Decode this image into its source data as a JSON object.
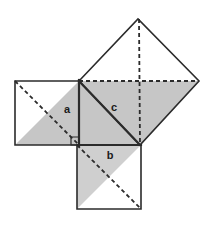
{
  "figure": {
    "type": "geometric-diagram",
    "name": "pythagorean-theorem-squares",
    "canvas": {
      "width": 209,
      "height": 225,
      "background": "#ffffff"
    },
    "colors": {
      "stroke": "#2b2b2b",
      "shade": "#c6c6c6",
      "shade_light": "#cfcfcf",
      "fill": "#ffffff",
      "label_text": "#1a1a1a"
    },
    "stroke_widths": {
      "outline": 1.6,
      "hypotenuse": 2.2,
      "dashed": 1.8
    },
    "dash_pattern": "4 3",
    "labels": {
      "a": {
        "text": "a",
        "x": 67,
        "y": 110
      },
      "b": {
        "text": "b",
        "x": 110,
        "y": 156
      },
      "c": {
        "text": "c",
        "x": 114,
        "y": 108
      }
    },
    "squares": {
      "a": {
        "name": "square-on-leg-a",
        "points": "15,81 79,81 79,145 15,145",
        "shaded_triangle": "15,145 79,81 79,145",
        "diagonal": {
          "x1": 15,
          "y1": 81,
          "x2": 79,
          "y2": 145
        }
      },
      "b": {
        "name": "square-on-leg-b",
        "points": "77,145 141,145 141,209 77,209",
        "shaded_triangle": "77,145 141,145 77,209",
        "diagonal": {
          "x1": 77,
          "y1": 145,
          "x2": 141,
          "y2": 209
        }
      },
      "c": {
        "name": "square-on-hypotenuse-c",
        "points": "79,81 138,19 199,81 140,145",
        "shaded_triangle": "79,81 140,145 109,113",
        "shaded_quad": "79,81 140,145 199,81 138,19",
        "shaded_half": "79,81 140,145 199,81",
        "diagonal_h": {
          "x1": 79,
          "y1": 81,
          "x2": 199,
          "y2": 81
        },
        "diagonal_v": {
          "x1": 138,
          "y1": 19,
          "x2": 140,
          "y2": 145
        }
      }
    },
    "right_triangle": {
      "name": "central-right-triangle",
      "points": "79,81 79,145 140,145",
      "vertices": {
        "apex": {
          "x": 79,
          "y": 81
        },
        "right_angle": {
          "x": 79,
          "y": 145
        },
        "base_end": {
          "x": 140,
          "y": 145
        }
      },
      "hypotenuse": {
        "x1": 79,
        "y1": 81,
        "x2": 140,
        "y2": 145
      },
      "right_angle_marker": "71,137 79,137 79,145 71,145"
    }
  }
}
